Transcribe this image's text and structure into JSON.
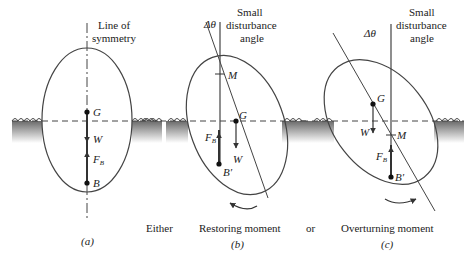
{
  "panels": {
    "a": {
      "axis_label_line1": "Line of",
      "axis_label_line2": "symmetry",
      "G": "G",
      "W": "W",
      "FB": "F",
      "FB_sub": "B",
      "B": "B",
      "caption": "(a)"
    },
    "b": {
      "angle_label": "Δθ",
      "angle_desc_line1": "Small",
      "angle_desc_line2": "disturbance",
      "angle_desc_line3": "angle",
      "M": "M",
      "G": "G",
      "FB": "F",
      "FB_sub": "B",
      "W": "W",
      "B": "B′",
      "moment": "Restoring moment",
      "caption": "(b)"
    },
    "c": {
      "angle_label": "Δθ",
      "angle_desc_line1": "Small",
      "angle_desc_line2": "disturbance",
      "angle_desc_line3": "angle",
      "G": "G",
      "W": "W",
      "M": "M",
      "FB": "F",
      "FB_sub": "B",
      "B": "B′",
      "moment": "Overturning moment",
      "caption": "(c)"
    },
    "connectors": {
      "either": "Either",
      "or": "or"
    }
  },
  "colors": {
    "line": "#333333",
    "water_top": "#555555",
    "water_bottom": "#ffffff"
  }
}
